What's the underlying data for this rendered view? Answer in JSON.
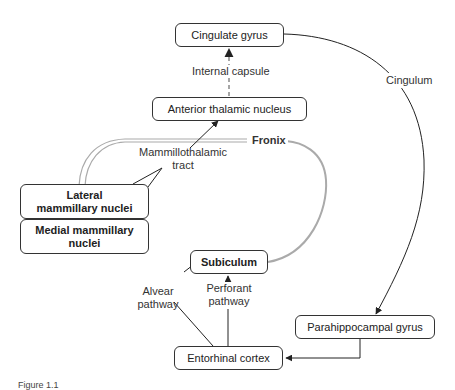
{
  "nodes": {
    "cingulate_gyrus": "Cingulate gyrus",
    "anterior_thalamic_nucleus": "Anterior thalamic nucleus",
    "lateral_mammillary_nuclei": "Lateral mammillary nuclei",
    "medial_mammillary_nuclei": "Medial mammillary nuclei",
    "subiculum": "Subiculum",
    "parahippocampal_gyrus": "Parahippocampal gyrus",
    "entorhinal_cortex": "Entorhinal cortex"
  },
  "edge_labels": {
    "internal_capsule": "Internal capsule",
    "cingulum": "Cingulum",
    "fornix": "Fronix",
    "mammillothalamic_line1": "Mammillothalamic",
    "mammillothalamic_line2": "tract",
    "alvear_line1": "Alvear",
    "alvear_line2": "pathway",
    "perforant_line1": "Perforant",
    "perforant_line2": "pathway"
  },
  "caption": "Figure 1.1",
  "colors": {
    "line": "#222222",
    "fornix": "#aaaaaa",
    "dashed": "#777777"
  }
}
